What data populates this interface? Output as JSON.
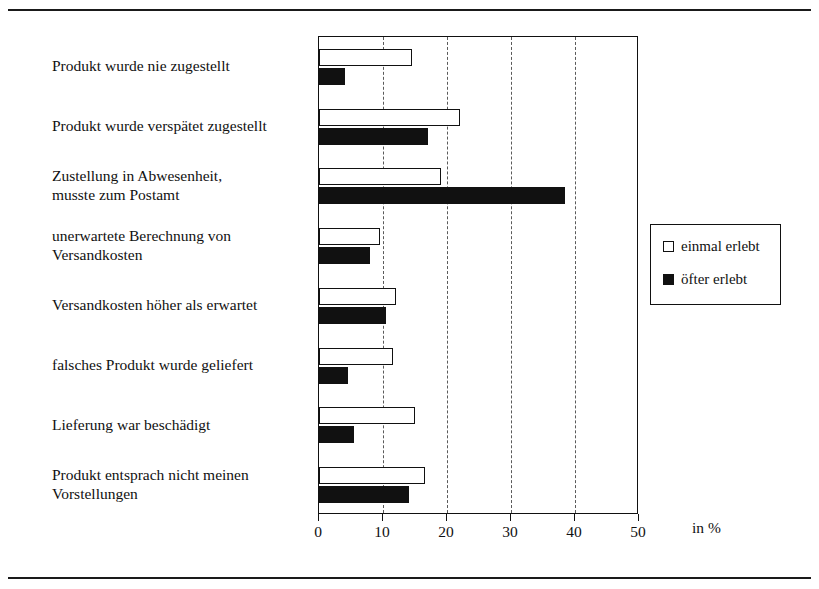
{
  "chart_data": {
    "type": "bar",
    "orientation": "horizontal",
    "title": "",
    "xlabel": "in %",
    "ylabel": "",
    "xlim": [
      0,
      50
    ],
    "xticks": [
      0,
      10,
      20,
      30,
      40,
      50
    ],
    "xticklabels": [
      "0",
      "10",
      "20",
      "30",
      "40",
      "50"
    ],
    "grid": "vertical-dashed",
    "legend_position": "right",
    "categories": [
      "Produkt wurde nie zugestellt",
      "Produkt wurde verspätet zugestellt",
      "Zustellung in Abwesenheit, musste zum Postamt",
      "unerwartete Berechnung von Versandkosten",
      "Versandkosten höher als erwartet",
      "falsches Produkt wurde geliefert",
      "Lieferung war beschädigt",
      "Produkt entsprach nicht meinen Vorstellungen"
    ],
    "category_lines": [
      [
        "Produkt wurde nie zugestellt"
      ],
      [
        "Produkt wurde verspätet zugestellt"
      ],
      [
        "Zustellung in Abwesenheit,",
        "musste zum Postamt"
      ],
      [
        "unerwartete Berechnung von",
        "Versandkosten"
      ],
      [
        "Versandkosten höher als erwartet"
      ],
      [
        "falsches Produkt wurde geliefert"
      ],
      [
        "Lieferung war beschädigt"
      ],
      [
        "Produkt entsprach nicht meinen",
        "Vorstellungen"
      ]
    ],
    "series": [
      {
        "name": "einmal erlebt",
        "color": "#ffffff",
        "edgecolor": "#111111",
        "values": [
          14.5,
          22.0,
          19.0,
          9.5,
          12.0,
          11.5,
          15.0,
          16.5
        ]
      },
      {
        "name": "öfter erlebt",
        "color": "#111111",
        "edgecolor": "#111111",
        "values": [
          4.0,
          17.0,
          38.5,
          8.0,
          10.5,
          4.5,
          5.5,
          14.0
        ]
      }
    ]
  },
  "legend": {
    "items": [
      {
        "label": "einmal erlebt",
        "swatch": "open-square"
      },
      {
        "label": "öfter erlebt",
        "swatch": "filled-square"
      }
    ]
  },
  "axis": {
    "unit_label": "in %"
  },
  "colors": {
    "ink": "#111111",
    "series_single": "#ffffff",
    "series_often": "#111111",
    "grid": "#5a5a5a",
    "background": "#ffffff"
  }
}
